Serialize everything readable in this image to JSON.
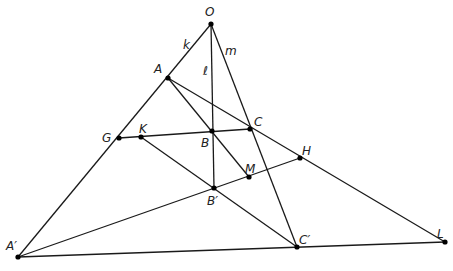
{
  "diagram": {
    "type": "projective-geometry-figure",
    "points": [
      {
        "id": "O",
        "label": "O",
        "x": 211,
        "y": 24,
        "lx": 205,
        "ly": 16
      },
      {
        "id": "A",
        "label": "A",
        "x": 168,
        "y": 78,
        "lx": 154,
        "ly": 73
      },
      {
        "id": "B",
        "label": "B",
        "x": 212,
        "y": 131,
        "lx": 201,
        "ly": 147
      },
      {
        "id": "C",
        "label": "C",
        "x": 250,
        "y": 129,
        "lx": 254,
        "ly": 126
      },
      {
        "id": "G",
        "label": "G",
        "x": 119,
        "y": 138,
        "lx": 102,
        "ly": 142
      },
      {
        "id": "K",
        "label": "K",
        "x": 141,
        "y": 137,
        "lx": 139,
        "ly": 133
      },
      {
        "id": "M",
        "label": "M",
        "x": 249,
        "y": 177,
        "lx": 245,
        "ly": 173
      },
      {
        "id": "H",
        "label": "H",
        "x": 300,
        "y": 158,
        "lx": 302,
        "ly": 155
      },
      {
        "id": "Bp",
        "label": "B′",
        "x": 214,
        "y": 188,
        "lx": 207,
        "ly": 205
      },
      {
        "id": "Ap",
        "label": "A′",
        "x": 18,
        "y": 257,
        "lx": 6,
        "ly": 250
      },
      {
        "id": "Cp",
        "label": "C′",
        "x": 297,
        "y": 247,
        "lx": 299,
        "ly": 244
      },
      {
        "id": "L",
        "label": "L",
        "x": 445,
        "y": 242,
        "lx": 437,
        "ly": 238
      }
    ],
    "segments": [
      {
        "name": "line-k-O-Aprime",
        "from": "O",
        "to": "Ap"
      },
      {
        "name": "line-l-O-Bprime",
        "from": "O",
        "to": "Bp"
      },
      {
        "name": "line-m-O-Cprime",
        "from": "O",
        "to": "Cp"
      },
      {
        "name": "line-A-L",
        "from": "A",
        "to": "L"
      },
      {
        "name": "line-G-C",
        "from": "G",
        "to": "C"
      },
      {
        "name": "line-K-Cprime",
        "from": "K",
        "to": "Cp"
      },
      {
        "name": "line-A-M",
        "from": "A",
        "to": "M"
      },
      {
        "name": "line-Aprime-H",
        "from": "Ap",
        "to": "H"
      },
      {
        "name": "line-Aprime-L",
        "from": "Ap",
        "to": "L"
      }
    ],
    "line_labels": [
      {
        "id": "k",
        "label": "k",
        "x": 183,
        "y": 49
      },
      {
        "id": "l",
        "label": "ℓ",
        "x": 203,
        "y": 75
      },
      {
        "id": "m",
        "label": "m",
        "x": 225,
        "y": 55
      }
    ]
  }
}
